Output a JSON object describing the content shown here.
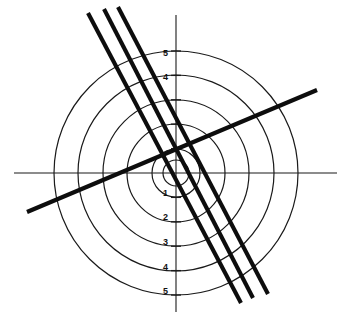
{
  "figure": {
    "background_color": "#ffffff",
    "line_color": "#0d0d0d",
    "grid_color": "#1a1a1a",
    "width": 343,
    "height": 324
  },
  "chart_data": {
    "type": "scatter",
    "title": "",
    "subtitle": "",
    "xlabel": "",
    "ylabel": "",
    "grid": true,
    "legend": false,
    "legend_position": "none",
    "coordinate_system": "polar-overlay-on-cartesian",
    "origin_px": {
      "x": 176,
      "y": 173
    },
    "pixels_per_unit": 24.4,
    "xlim": [
      -7.2,
      6.8
    ],
    "ylim": [
      -6.2,
      7.1
    ],
    "axes": {
      "x_axis": {
        "visible": true,
        "from_px": {
          "x": 14,
          "y": 173
        },
        "to_px": {
          "x": 337,
          "y": 173
        }
      },
      "y_axis": {
        "visible": true,
        "from_px": {
          "x": 176,
          "y": 15
        },
        "to_px": {
          "x": 176,
          "y": 312
        }
      }
    },
    "y_tick_labels_above": [
      "5",
      "4"
    ],
    "y_tick_labels_below": [
      "1",
      "2",
      "3",
      "4",
      "5"
    ],
    "y_ticks_units": [
      5,
      4,
      3,
      2,
      1,
      -1,
      -2,
      -3,
      -4,
      -5
    ],
    "y_tick_labels_rendered": [
      {
        "text": "5",
        "unit": 5,
        "x_px": 168,
        "y_px": 54
      },
      {
        "text": "4",
        "unit": 4,
        "x_px": 168,
        "y_px": 78
      },
      {
        "text": "1",
        "unit": -1,
        "x_px": 168,
        "y_px": 194
      },
      {
        "text": "2",
        "unit": -2,
        "x_px": 168,
        "y_px": 218
      },
      {
        "text": "3",
        "unit": -3,
        "x_px": 168,
        "y_px": 243
      },
      {
        "text": "4",
        "unit": -4,
        "x_px": 168,
        "y_px": 268
      },
      {
        "text": "5",
        "unit": -5,
        "x_px": 168,
        "y_px": 292
      }
    ],
    "circles": [
      {
        "name": "ring-1-inner-small",
        "radius_units": 0.55,
        "radius_px": 13
      },
      {
        "name": "ring-2",
        "radius_units": 1.0,
        "radius_px": 24
      },
      {
        "name": "ring-3",
        "radius_units": 2.0,
        "radius_px": 49
      },
      {
        "name": "ring-4",
        "radius_units": 3.0,
        "radius_px": 73
      },
      {
        "name": "ring-5",
        "radius_units": 4.0,
        "radius_px": 98
      },
      {
        "name": "ring-6",
        "radius_units": 5.0,
        "radius_px": 122
      }
    ],
    "lines": [
      {
        "name": "line-parallel-left",
        "style": "thick",
        "slope": -2.22,
        "from_px": {
          "x": 88,
          "y": 13
        },
        "to_px": {
          "x": 241,
          "y": 303
        }
      },
      {
        "name": "line-parallel-middle",
        "style": "thick",
        "slope": -2.22,
        "from_px": {
          "x": 104,
          "y": 9
        },
        "to_px": {
          "x": 253,
          "y": 298
        }
      },
      {
        "name": "line-parallel-right",
        "style": "thick",
        "slope": -2.22,
        "from_px": {
          "x": 118,
          "y": 7
        },
        "to_px": {
          "x": 268,
          "y": 294
        }
      },
      {
        "name": "line-ascending",
        "style": "thick",
        "slope": 0.43,
        "from_px": {
          "x": 27,
          "y": 212
        },
        "to_px": {
          "x": 317,
          "y": 90
        }
      }
    ]
  }
}
